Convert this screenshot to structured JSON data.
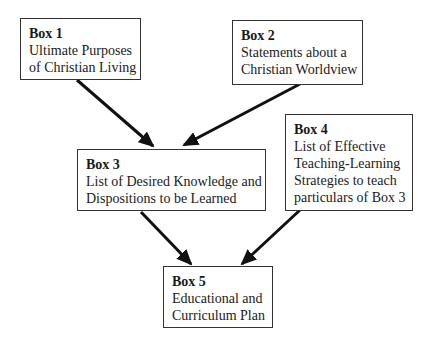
{
  "diagram": {
    "boxes": [
      {
        "id": "box1",
        "title": "Box 1",
        "lines": [
          "Ultimate Purposes",
          "of Christian Living"
        ]
      },
      {
        "id": "box2",
        "title": "Box 2",
        "lines": [
          "Statements about a",
          "Christian Worldview"
        ]
      },
      {
        "id": "box3",
        "title": "Box 3",
        "lines": [
          "List of Desired Knowledge and",
          "Dispositions to be Learned"
        ]
      },
      {
        "id": "box4",
        "title": "Box 4",
        "lines": [
          "List of Effective",
          "Teaching-Learning",
          "Strategies to teach",
          "particulars of Box 3"
        ]
      },
      {
        "id": "box5",
        "title": "Box 5",
        "lines": [
          "Educational and",
          "Curriculum Plan"
        ]
      }
    ],
    "edges": [
      {
        "from": "box1",
        "to": "box3"
      },
      {
        "from": "box2",
        "to": "box3"
      },
      {
        "from": "box3",
        "to": "box5"
      },
      {
        "from": "box4",
        "to": "box5"
      }
    ],
    "colors": {
      "border": "#333333",
      "arrow": "#111111",
      "text": "#1a1a1a"
    }
  }
}
